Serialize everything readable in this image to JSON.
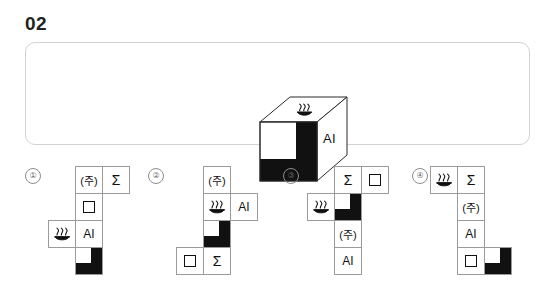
{
  "header": {
    "question_number": "02"
  },
  "stimulus": {
    "cube": {
      "top_face_symbol": "hot-spring-symbol",
      "front_face_pattern": "black-L-shape",
      "right_face_label": "AI"
    }
  },
  "options": [
    {
      "number": "①",
      "cells": [
        {
          "type": "text",
          "value": "(주)",
          "col": 1,
          "row": 0
        },
        {
          "type": "text",
          "value": "Σ",
          "col": 2,
          "row": 0
        },
        {
          "type": "square",
          "value": "",
          "col": 1,
          "row": 1
        },
        {
          "type": "hs",
          "value": "",
          "col": 0,
          "row": 2
        },
        {
          "type": "text",
          "value": "AI",
          "col": 1,
          "row": 2
        },
        {
          "type": "lshape",
          "value": "",
          "col": 1,
          "row": 3
        }
      ]
    },
    {
      "number": "②",
      "cells": [
        {
          "type": "text",
          "value": "(주)",
          "col": 1,
          "row": 0
        },
        {
          "type": "hs",
          "value": "",
          "col": 1,
          "row": 1
        },
        {
          "type": "text",
          "value": "AI",
          "col": 2,
          "row": 1
        },
        {
          "type": "lshape",
          "value": "",
          "col": 1,
          "row": 2
        },
        {
          "type": "square",
          "value": "",
          "col": 0,
          "row": 3
        },
        {
          "type": "text",
          "value": "Σ",
          "col": 1,
          "row": 3
        }
      ]
    },
    {
      "number": "③",
      "cells": [
        {
          "type": "text",
          "value": "Σ",
          "col": 1,
          "row": 0
        },
        {
          "type": "square",
          "value": "",
          "col": 2,
          "row": 0
        },
        {
          "type": "hs",
          "value": "",
          "col": 0,
          "row": 1
        },
        {
          "type": "lshape",
          "value": "",
          "col": 1,
          "row": 1
        },
        {
          "type": "text",
          "value": "(주)",
          "col": 1,
          "row": 2
        },
        {
          "type": "text",
          "value": "AI",
          "col": 1,
          "row": 3
        }
      ]
    },
    {
      "number": "④",
      "cells": [
        {
          "type": "hs",
          "value": "",
          "col": 0,
          "row": 0
        },
        {
          "type": "text",
          "value": "Σ",
          "col": 1,
          "row": 0
        },
        {
          "type": "text",
          "value": "(주)",
          "col": 1,
          "row": 1
        },
        {
          "type": "text",
          "value": "AI",
          "col": 1,
          "row": 2
        },
        {
          "type": "square",
          "value": "",
          "col": 1,
          "row": 3
        },
        {
          "type": "lshape",
          "value": "",
          "col": 2,
          "row": 3
        }
      ]
    }
  ],
  "layout": {
    "option_left_offsets": [
      25,
      148,
      283,
      412
    ],
    "net_left_offsets": [
      23,
      28,
      24,
      18
    ]
  },
  "colors": {
    "ink": "#111111",
    "panel_border": "#d2d2d2",
    "cell_border": "#9b9b9b",
    "option_number": "#6c6c6c",
    "background": "#ffffff"
  }
}
